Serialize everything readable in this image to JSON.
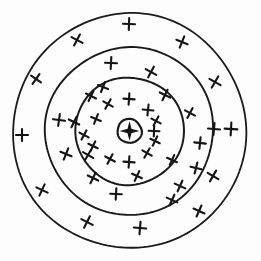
{
  "figure": {
    "background_color": "#fdfdfd",
    "ink_color": "#1a1a1a",
    "width": 261,
    "height": 261
  },
  "chart_data": {
    "type": "scatter",
    "subtitle": "",
    "xlabel": "",
    "ylabel": "",
    "grid": false,
    "legend": false,
    "axes_visible": false,
    "center": {
      "x": 129.5,
      "y": 131.0
    },
    "rings": [
      {
        "name": "core-circle",
        "radius": 12.0,
        "stroke_width": 2.2,
        "mark_count_inside": 0
      },
      {
        "name": "inner-ring",
        "radius": 54.0,
        "stroke_width": 2.0,
        "mark_count_inside": 14
      },
      {
        "name": "middle-ring",
        "radius": 84.0,
        "stroke_width": 1.9,
        "mark_count_inside": 14
      },
      {
        "name": "outer-ring",
        "radius": 117.0,
        "stroke_width": 1.8,
        "mark_count_inside": 15
      }
    ],
    "center_marker": {
      "shape": "four-pointed-star",
      "filled": true,
      "radius_outer": 7.5,
      "radius_inner": 2.2,
      "color": "#111111"
    },
    "marks": {
      "glyph": "cross",
      "total": 43,
      "stroke_width": 2.1,
      "color": "#141414",
      "points": [
        {
          "x": 129,
          "y": 24,
          "size": 6.0,
          "rot": 2
        },
        {
          "x": 77,
          "y": 40,
          "size": 6.2,
          "rot": 28
        },
        {
          "x": 182,
          "y": 42,
          "size": 6.0,
          "rot": 22
        },
        {
          "x": 36,
          "y": 79,
          "size": 6.0,
          "rot": 35
        },
        {
          "x": 215,
          "y": 82,
          "size": 6.4,
          "rot": 30
        },
        {
          "x": 22,
          "y": 135,
          "size": 6.0,
          "rot": 0
        },
        {
          "x": 214,
          "y": 129,
          "size": 6.0,
          "rot": 5
        },
        {
          "x": 231,
          "y": 129,
          "size": 6.4,
          "rot": 3
        },
        {
          "x": 42,
          "y": 190,
          "size": 6.2,
          "rot": 25
        },
        {
          "x": 87,
          "y": 222,
          "size": 6.4,
          "rot": 27
        },
        {
          "x": 140,
          "y": 228,
          "size": 6.2,
          "rot": 5
        },
        {
          "x": 199,
          "y": 211,
          "size": 6.0,
          "rot": 24
        },
        {
          "x": 213,
          "y": 176,
          "size": 6.2,
          "rot": 30
        },
        {
          "x": 196,
          "y": 168,
          "size": 5.6,
          "rot": 14
        },
        {
          "x": 111,
          "y": 63,
          "size": 6.0,
          "rot": 3
        },
        {
          "x": 151,
          "y": 72,
          "size": 6.0,
          "rot": 28
        },
        {
          "x": 59,
          "y": 120,
          "size": 6.0,
          "rot": 8
        },
        {
          "x": 74,
          "y": 122,
          "size": 5.8,
          "rot": 26
        },
        {
          "x": 66,
          "y": 154,
          "size": 6.0,
          "rot": 22
        },
        {
          "x": 88,
          "y": 155,
          "size": 5.8,
          "rot": 30
        },
        {
          "x": 93,
          "y": 178,
          "size": 5.8,
          "rot": 26
        },
        {
          "x": 180,
          "y": 186,
          "size": 5.8,
          "rot": 24
        },
        {
          "x": 200,
          "y": 143,
          "size": 5.8,
          "rot": 6
        },
        {
          "x": 190,
          "y": 113,
          "size": 5.6,
          "rot": 28
        },
        {
          "x": 165,
          "y": 95,
          "size": 5.8,
          "rot": 26
        },
        {
          "x": 116,
          "y": 194,
          "size": 5.8,
          "rot": 3
        },
        {
          "x": 172,
          "y": 200,
          "size": 5.8,
          "rot": 24
        },
        {
          "x": 91,
          "y": 96,
          "size": 5.6,
          "rot": 26
        },
        {
          "x": 129,
          "y": 99,
          "size": 5.6,
          "rot": 4
        },
        {
          "x": 108,
          "y": 104,
          "size": 5.4,
          "rot": 30
        },
        {
          "x": 148,
          "y": 110,
          "size": 5.4,
          "rot": 6
        },
        {
          "x": 156,
          "y": 121,
          "size": 5.2,
          "rot": 28
        },
        {
          "x": 154,
          "y": 131,
          "size": 5.4,
          "rot": 2
        },
        {
          "x": 155,
          "y": 141,
          "size": 5.2,
          "rot": 26
        },
        {
          "x": 147,
          "y": 153,
          "size": 5.4,
          "rot": 30
        },
        {
          "x": 129,
          "y": 162,
          "size": 5.6,
          "rot": 4
        },
        {
          "x": 110,
          "y": 159,
          "size": 5.4,
          "rot": 28
        },
        {
          "x": 93,
          "y": 146,
          "size": 5.2,
          "rot": 26
        },
        {
          "x": 96,
          "y": 119,
          "size": 5.2,
          "rot": 22
        },
        {
          "x": 84,
          "y": 135,
          "size": 5.2,
          "rot": 28
        },
        {
          "x": 137,
          "y": 176,
          "size": 5.4,
          "rot": 25
        },
        {
          "x": 103,
          "y": 87,
          "size": 5.4,
          "rot": 22
        },
        {
          "x": 172,
          "y": 160,
          "size": 5.4,
          "rot": 24
        }
      ]
    }
  }
}
